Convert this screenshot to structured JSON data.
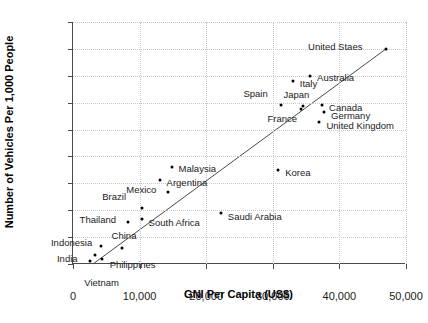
{
  "chart_data": {
    "type": "scatter",
    "title": "",
    "xlabel": "GNI Per Capita (US$)",
    "ylabel": "Number of Vehicles Per 1,000 People",
    "xlim": [
      0,
      50000
    ],
    "ylim": [
      0,
      900
    ],
    "xticks": [
      0,
      10000,
      20000,
      30000,
      40000,
      50000
    ],
    "xtick_labels": [
      "0",
      "10,000",
      "20,000",
      "30,000",
      "40,000",
      "50,000"
    ],
    "yticks": [
      0,
      100,
      200,
      300,
      400,
      500,
      600,
      700,
      800,
      900
    ],
    "ytick_labels": [
      "0",
      "100",
      "200",
      "300",
      "400",
      "500",
      "600",
      "700",
      "800",
      "900"
    ],
    "grid": true,
    "legend": false,
    "marker_color": "#000000",
    "trendline": {
      "present": true,
      "color": "#4a4a4a",
      "x_start": 3000,
      "y_start": 0,
      "x_end": 47000,
      "y_end": 800
    },
    "points": [
      {
        "label": "Vietnam",
        "x": 2600,
        "y": 12,
        "lx": -6,
        "ly": 22,
        "anchor": "start"
      },
      {
        "label": "India",
        "x": 3300,
        "y": 32,
        "lx": -38,
        "ly": 4,
        "anchor": "start"
      },
      {
        "label": "Philippines",
        "x": 4300,
        "y": 18,
        "lx": 8,
        "ly": 6,
        "anchor": "start"
      },
      {
        "label": "Indonesia",
        "x": 4200,
        "y": 68,
        "lx": -50,
        "ly": -3,
        "anchor": "start"
      },
      {
        "label": "China",
        "x": 7300,
        "y": 58,
        "lx": -10,
        "ly": -12,
        "anchor": "start"
      },
      {
        "label": "Thailand",
        "x": 8200,
        "y": 157,
        "lx": -48,
        "ly": -2,
        "anchor": "start"
      },
      {
        "label": "Brazil",
        "x": 10400,
        "y": 210,
        "lx": -40,
        "ly": -11,
        "anchor": "start"
      },
      {
        "label": "South Africa",
        "x": 10300,
        "y": 168,
        "lx": 7,
        "ly": 4,
        "anchor": "start"
      },
      {
        "label": "Mexico",
        "x": 14300,
        "y": 268,
        "lx": -42,
        "ly": -2,
        "anchor": "start"
      },
      {
        "label": "Argentina",
        "x": 13000,
        "y": 312,
        "lx": 7,
        "ly": 3,
        "anchor": "start"
      },
      {
        "label": "Malaysia",
        "x": 14800,
        "y": 362,
        "lx": 7,
        "ly": 2,
        "anchor": "start"
      },
      {
        "label": "Saudi Arabia",
        "x": 22200,
        "y": 188,
        "lx": 7,
        "ly": 4,
        "anchor": "start"
      },
      {
        "label": "Korea",
        "x": 30800,
        "y": 350,
        "lx": 7,
        "ly": 3,
        "anchor": "start"
      },
      {
        "label": "Spain",
        "x": 31300,
        "y": 590,
        "lx": -38,
        "ly": -11,
        "anchor": "start"
      },
      {
        "label": "Italy",
        "x": 33000,
        "y": 682,
        "lx": 7,
        "ly": 3,
        "anchor": "start"
      },
      {
        "label": "France",
        "x": 34300,
        "y": 578,
        "lx": -34,
        "ly": 10,
        "anchor": "start"
      },
      {
        "label": "Japan",
        "x": 34600,
        "y": 588,
        "lx": -20,
        "ly": -11,
        "anchor": "start"
      },
      {
        "label": "Australia",
        "x": 35600,
        "y": 698,
        "lx": 7,
        "ly": 2,
        "anchor": "start"
      },
      {
        "label": "Canada",
        "x": 37400,
        "y": 592,
        "lx": 7,
        "ly": 3,
        "anchor": "start"
      },
      {
        "label": "Germany",
        "x": 37700,
        "y": 564,
        "lx": 7,
        "ly": 4,
        "anchor": "start"
      },
      {
        "label": "United Kingdom",
        "x": 37000,
        "y": 528,
        "lx": 7,
        "ly": 4,
        "anchor": "start"
      },
      {
        "label": "United Staes",
        "x": 47000,
        "y": 800,
        "lx": -78,
        "ly": -2,
        "anchor": "start"
      }
    ]
  }
}
